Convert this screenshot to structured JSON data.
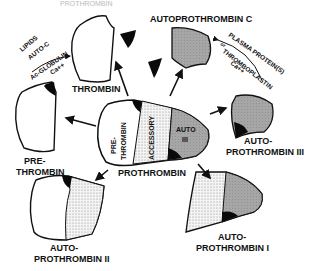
{
  "diagram": {
    "header_text": "PROTHROMBIN",
    "center": {
      "label": "PROTHROMBIN",
      "segments": [
        "PRE-",
        "THROMBIN",
        "ACCESSORY",
        "AUTO",
        "III"
      ]
    },
    "nodes": {
      "thrombin": "THROMBIN",
      "autoprothrombin_c": "AUTOPROTHROMBIN C",
      "prethrombin_1": "PRE-",
      "prethrombin_2": "THROMBIN",
      "ap3_1": "AUTO-",
      "ap3_2": "PROTHROMBIN III",
      "ap2_1": "AUTO-",
      "ap2_2": "PROTHROMBIN II",
      "ap1_1": "AUTO-",
      "ap1_2": "PROTHROMBIN I"
    },
    "annotations": {
      "left": [
        "LIPIDS",
        "AUTO-C",
        "Ac-GLOBULIN",
        "Ca++"
      ],
      "right": [
        "PLASMA PROTEIN(S)",
        "or",
        "THROMBOPLASTIN",
        "Ca++"
      ]
    },
    "colors": {
      "line": "#111111",
      "gray_fill": "#a9a9a9",
      "dot_fill": "#e8e8e8",
      "black": "#0a0a0a"
    }
  }
}
